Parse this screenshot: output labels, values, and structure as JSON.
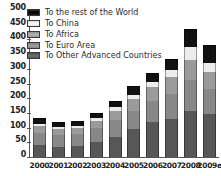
{
  "chart_data": {
    "type": "bar",
    "stacked": true,
    "title": "",
    "xlabel": "",
    "ylabel": "",
    "ylim": [
      0,
      500
    ],
    "ytick_step": 50,
    "yticks": [
      500,
      450,
      400,
      350,
      300,
      250,
      200,
      150,
      100,
      50,
      0
    ],
    "grid": false,
    "legend_position": "top-left",
    "categories": [
      "2000",
      "2001",
      "2002",
      "2003",
      "2004",
      "2005",
      "2006",
      "2007",
      "2008",
      "2009e"
    ],
    "series": [
      {
        "name": "To Other Advanced Countries",
        "color": "#575757",
        "values": [
          40,
          35,
          37,
          51,
          68,
          94,
          118,
          128,
          158,
          145
        ]
      },
      {
        "name": "To Euro Area",
        "color": "#888888",
        "values": [
          43,
          40,
          41,
          48,
          57,
          63,
          72,
          85,
          104,
          86
        ]
      },
      {
        "name": "To Africa",
        "color": "#9b9b9b",
        "values": [
          22,
          21,
          21,
          25,
          32,
          39,
          47,
          60,
          69,
          58
        ]
      },
      {
        "name": "To China",
        "color": "#ececec",
        "values": [
          6,
          6,
          7,
          9,
          13,
          16,
          19,
          22,
          45,
          32
        ]
      },
      {
        "name": "To the rest of the World",
        "color": "#111111",
        "values": [
          21,
          16,
          18,
          18,
          20,
          28,
          29,
          38,
          61,
          59
        ]
      }
    ],
    "totals": [
      132,
      118,
      124,
      151,
      190,
      240,
      285,
      333,
      437,
      380
    ]
  },
  "legend": {
    "items": [
      {
        "label": "To the rest of the World",
        "swatch": "swatch-rest-of-world"
      },
      {
        "label": "To China",
        "swatch": "swatch-china"
      },
      {
        "label": "To Africa",
        "swatch": "swatch-africa"
      },
      {
        "label": "To Euro Area",
        "swatch": "swatch-euro-area"
      },
      {
        "label": "To Other Advanced Countries",
        "swatch": "swatch-other-advanced"
      }
    ]
  }
}
